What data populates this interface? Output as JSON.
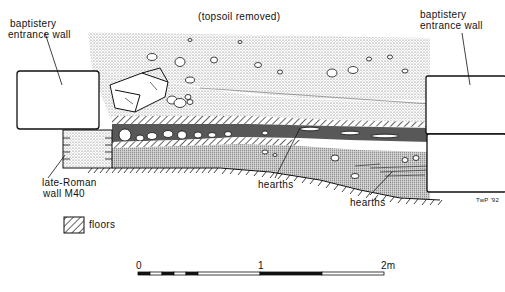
{
  "labels": {
    "topsoil": "(topsoil removed)",
    "left_wall_line1": "baptistery",
    "left_wall_line2": "entrance wall",
    "right_wall_line1": "baptistery",
    "right_wall_line2": "entrance wall",
    "roman_wall_line1": "late-Roman",
    "roman_wall_line2": "wall M40",
    "hearths_1": "hearths",
    "hearths_2": "hearths",
    "signature": "TwP '92"
  },
  "legend": {
    "floors_label": "floors",
    "floors_icon": "hatched-square"
  },
  "scale_bar": {
    "tick_0": "0",
    "tick_1": "1",
    "tick_2": "2m"
  },
  "colors": {
    "ink": "#111111",
    "paper": "#ffffff",
    "stipple": "#cfcfcf"
  }
}
